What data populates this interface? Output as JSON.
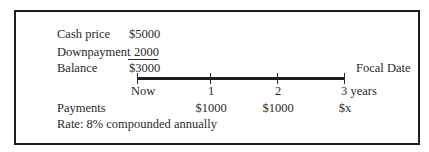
{
  "ledger": {
    "rows": [
      {
        "label": "Cash price",
        "value": "$5000"
      },
      {
        "label": "Downpayment",
        "value": "2000"
      },
      {
        "label": "Balance",
        "value": "$3000"
      }
    ]
  },
  "timeline": {
    "focal_label": "Focal Date",
    "ticks": [
      {
        "label": "Now",
        "payment": ""
      },
      {
        "label": "1",
        "payment": "$1000"
      },
      {
        "label": "2",
        "payment": "$1000"
      },
      {
        "label": "3 years",
        "payment": "$x"
      }
    ],
    "payments_label": "Payments",
    "rate_text": "Rate: 8% compounded annually"
  }
}
